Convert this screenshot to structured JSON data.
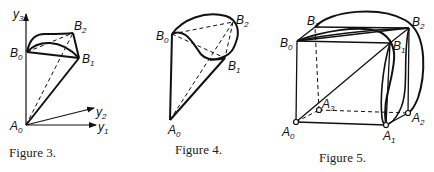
{
  "figures": [
    {
      "caption": "Figure 3.",
      "labels": {
        "B0": {
          "base": "B",
          "sub": "0"
        },
        "B1": {
          "base": "B",
          "sub": "1"
        },
        "B2": {
          "base": "B",
          "sub": "2"
        },
        "A0": {
          "base": "A",
          "sub": "0"
        },
        "y1": {
          "base": "y",
          "sub": "1"
        },
        "y2": {
          "base": "y",
          "sub": "2"
        },
        "y3": {
          "base": "y",
          "sub": "3"
        }
      }
    },
    {
      "caption": "Figure 4.",
      "labels": {
        "B0": {
          "base": "B",
          "sub": "0"
        },
        "B1": {
          "base": "B",
          "sub": "1"
        },
        "B2": {
          "base": "B",
          "sub": "2"
        },
        "A0": {
          "base": "A",
          "sub": "0"
        }
      }
    },
    {
      "caption": "Figure 5.",
      "labels": {
        "B0": {
          "base": "B",
          "sub": "0"
        },
        "B1": {
          "base": "B",
          "sub": "1"
        },
        "B2": {
          "base": "B",
          "sub": "2"
        },
        "B3": {
          "base": "B",
          "sub": "3"
        },
        "A0": {
          "base": "A",
          "sub": "0"
        },
        "A1": {
          "base": "A",
          "sub": "1"
        },
        "A2": {
          "base": "A",
          "sub": "2"
        },
        "A3": {
          "base": "A",
          "sub": "3"
        }
      }
    }
  ]
}
